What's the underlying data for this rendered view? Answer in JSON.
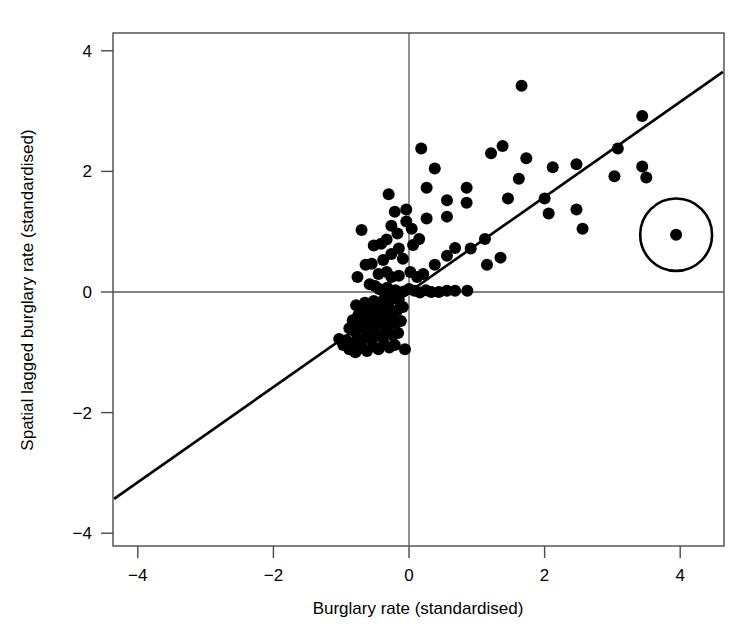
{
  "chart_data": {
    "type": "scatter",
    "title": "",
    "xlabel": "Burglary rate (standardised)",
    "ylabel": "Spatial lagged burglary rate (standardised)",
    "xlim": [
      -4.35,
      4.65
    ],
    "ylim": [
      -4.3,
      4.4
    ],
    "xticks": [
      -4,
      -2,
      0,
      2,
      4
    ],
    "xtick_labels": [
      "−4",
      "−2",
      "0",
      "2",
      "4"
    ],
    "yticks": [
      -4,
      -2,
      0,
      2,
      4
    ],
    "ytick_labels": [
      "−4",
      "−2",
      "0",
      "2",
      "4"
    ],
    "grid": false,
    "legend": "none",
    "reference_lines": {
      "horizontal_at_y": 0,
      "vertical_at_x": 0
    },
    "fit_line": {
      "description": "least-squares / Moran scatterplot slope line",
      "x_start": -4.35,
      "y_start": -3.43,
      "x_end": 4.63,
      "y_end": 3.65,
      "slope": 0.789,
      "intercept": 0.0
    },
    "annotation_circle": {
      "label": "circled outlier",
      "center_x": 3.94,
      "center_y": 0.95,
      "radius_x_units": 0.53,
      "radius_y_units": 0.6
    },
    "point_color": "#000000",
    "point_radius_px": 6,
    "n_points": 131,
    "points": [
      [
        1.66,
        3.42
      ],
      [
        1.38,
        2.42
      ],
      [
        1.21,
        2.3
      ],
      [
        1.73,
        2.22
      ],
      [
        3.44,
        2.92
      ],
      [
        3.44,
        2.08
      ],
      [
        3.08,
        2.38
      ],
      [
        3.03,
        1.92
      ],
      [
        2.47,
        2.12
      ],
      [
        2.12,
        2.07
      ],
      [
        1.62,
        1.88
      ],
      [
        1.46,
        1.55
      ],
      [
        2.0,
        1.55
      ],
      [
        2.47,
        1.37
      ],
      [
        2.06,
        1.3
      ],
      [
        2.56,
        1.05
      ],
      [
        3.5,
        1.9
      ],
      [
        3.94,
        0.95
      ],
      [
        0.18,
        2.38
      ],
      [
        0.38,
        2.05
      ],
      [
        0.26,
        1.73
      ],
      [
        0.85,
        1.73
      ],
      [
        0.56,
        1.52
      ],
      [
        0.56,
        1.25
      ],
      [
        0.85,
        1.48
      ],
      [
        -0.04,
        1.37
      ],
      [
        -0.3,
        1.62
      ],
      [
        -0.21,
        1.33
      ],
      [
        -0.04,
        1.17
      ],
      [
        0.26,
        1.22
      ],
      [
        -0.7,
        1.03
      ],
      [
        -0.26,
        1.1
      ],
      [
        -0.17,
        0.97
      ],
      [
        0.04,
        1.05
      ],
      [
        -0.33,
        0.87
      ],
      [
        -0.41,
        0.8
      ],
      [
        -0.52,
        0.77
      ],
      [
        -0.15,
        0.72
      ],
      [
        0.06,
        0.78
      ],
      [
        0.15,
        0.88
      ],
      [
        -0.26,
        0.63
      ],
      [
        -0.09,
        0.55
      ],
      [
        -0.38,
        0.53
      ],
      [
        -0.55,
        0.47
      ],
      [
        -0.64,
        0.45
      ],
      [
        -0.76,
        0.25
      ],
      [
        -0.45,
        0.3
      ],
      [
        -0.33,
        0.33
      ],
      [
        -0.26,
        0.25
      ],
      [
        -0.15,
        0.27
      ],
      [
        0.02,
        0.33
      ],
      [
        0.12,
        0.25
      ],
      [
        0.21,
        0.3
      ],
      [
        0.38,
        0.45
      ],
      [
        0.56,
        0.6
      ],
      [
        0.68,
        0.73
      ],
      [
        0.91,
        0.72
      ],
      [
        1.12,
        0.88
      ],
      [
        1.15,
        0.45
      ],
      [
        1.35,
        0.57
      ],
      [
        -0.58,
        0.13
      ],
      [
        -0.5,
        0.1
      ],
      [
        -0.44,
        0.05
      ],
      [
        -0.38,
        0.02
      ],
      [
        -0.32,
        0.07
      ],
      [
        -0.26,
        0.01
      ],
      [
        -0.2,
        0.03
      ],
      [
        -0.14,
        -0.02
      ],
      [
        -0.08,
        0.01
      ],
      [
        0.0,
        0.05
      ],
      [
        0.08,
        0.02
      ],
      [
        0.16,
        -0.01
      ],
      [
        0.25,
        0.03
      ],
      [
        0.33,
        0.0
      ],
      [
        0.44,
        0.0
      ],
      [
        0.56,
        0.02
      ],
      [
        0.68,
        0.02
      ],
      [
        0.86,
        0.02
      ],
      [
        -0.15,
        -0.13
      ],
      [
        -0.22,
        -0.1
      ],
      [
        -0.3,
        -0.17
      ],
      [
        -0.37,
        -0.12
      ],
      [
        -0.44,
        -0.2
      ],
      [
        -0.52,
        -0.15
      ],
      [
        -0.58,
        -0.23
      ],
      [
        -0.65,
        -0.18
      ],
      [
        -0.71,
        -0.27
      ],
      [
        -0.78,
        -0.22
      ],
      [
        -0.09,
        -0.25
      ],
      [
        -0.17,
        -0.3
      ],
      [
        -0.24,
        -0.35
      ],
      [
        -0.32,
        -0.28
      ],
      [
        -0.4,
        -0.38
      ],
      [
        -0.47,
        -0.32
      ],
      [
        -0.54,
        -0.41
      ],
      [
        -0.61,
        -0.36
      ],
      [
        -0.68,
        -0.44
      ],
      [
        -0.75,
        -0.39
      ],
      [
        -0.83,
        -0.47
      ],
      [
        -0.12,
        -0.48
      ],
      [
        -0.2,
        -0.52
      ],
      [
        -0.28,
        -0.45
      ],
      [
        -0.35,
        -0.55
      ],
      [
        -0.43,
        -0.5
      ],
      [
        -0.5,
        -0.58
      ],
      [
        -0.58,
        -0.53
      ],
      [
        -0.65,
        -0.62
      ],
      [
        -0.72,
        -0.57
      ],
      [
        -0.8,
        -0.65
      ],
      [
        -0.88,
        -0.6
      ],
      [
        -0.16,
        -0.68
      ],
      [
        -0.24,
        -0.72
      ],
      [
        -0.31,
        -0.65
      ],
      [
        -0.39,
        -0.75
      ],
      [
        -0.46,
        -0.7
      ],
      [
        -0.54,
        -0.78
      ],
      [
        -0.61,
        -0.73
      ],
      [
        -0.69,
        -0.82
      ],
      [
        -0.76,
        -0.77
      ],
      [
        -0.84,
        -0.85
      ],
      [
        -0.92,
        -0.8
      ],
      [
        -0.21,
        -0.88
      ],
      [
        -0.29,
        -0.92
      ],
      [
        -0.37,
        -0.86
      ],
      [
        -0.45,
        -0.95
      ],
      [
        -0.53,
        -0.9
      ],
      [
        -0.62,
        -0.98
      ],
      [
        -0.7,
        -0.93
      ],
      [
        -0.79,
        -1.0
      ],
      [
        -0.88,
        -0.95
      ],
      [
        -0.97,
        -0.88
      ],
      [
        -1.03,
        -0.78
      ],
      [
        -0.06,
        -0.95
      ]
    ]
  },
  "figure": {
    "background_color": "#ffffff",
    "frame_color": "#4a4a4a",
    "fit_line_color": "#000000"
  }
}
